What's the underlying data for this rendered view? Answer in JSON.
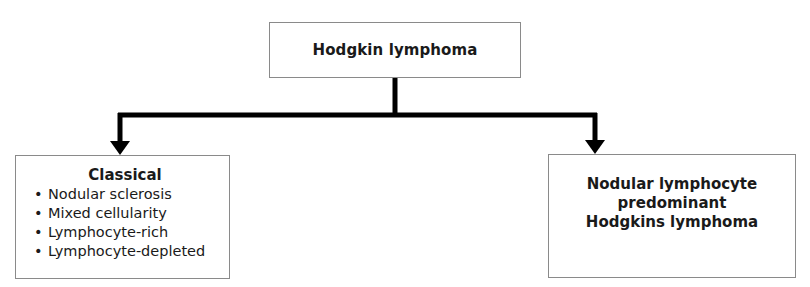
{
  "diagram": {
    "root": {
      "label": "Hodgkin lymphoma"
    },
    "children": [
      {
        "title": "Classical",
        "items": [
          "Nodular sclerosis",
          "Mixed cellularity",
          "Lymphocyte-rich",
          "Lymphocyte-depleted"
        ]
      },
      {
        "title_lines": [
          "Nodular lymphocyte",
          "predominant",
          "Hodgkins lymphoma"
        ]
      }
    ],
    "bullet_glyph": "•",
    "colors": {
      "connector": "#000000",
      "box_border": "#8a8a8a",
      "text": "#1a1a1a"
    }
  }
}
